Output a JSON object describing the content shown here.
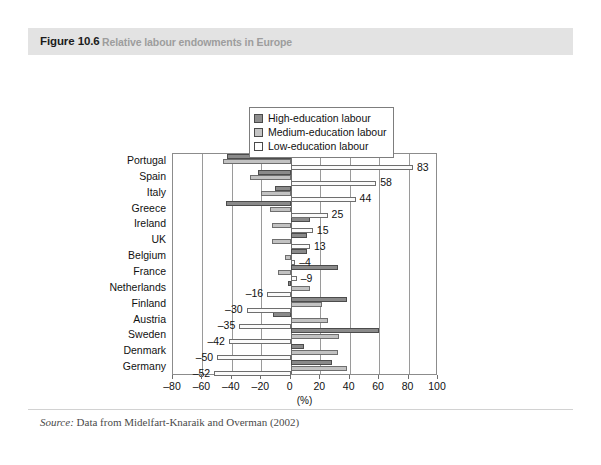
{
  "figure": {
    "number": "Figure 10.6",
    "caption": "Relative labour endowments in Europe",
    "source_keyword": "Source:",
    "source_text": " Data from Midelfart-Knaraik and Overman (2002)"
  },
  "legend": {
    "items": [
      {
        "label": "High-education labour",
        "key": "high",
        "color": "#8a8a8a"
      },
      {
        "label": "Medium-education labour",
        "key": "medium",
        "color": "#c2c2c2"
      },
      {
        "label": "Low-education labour",
        "key": "low",
        "color": "#ffffff"
      }
    ]
  },
  "chart_data": {
    "type": "bar",
    "orientation": "horizontal",
    "title": "Relative labour endowments in Europe",
    "xlabel": "(%)",
    "ylabel": "",
    "xlim": [
      -80,
      100
    ],
    "xticks": [
      -80,
      -60,
      -40,
      -20,
      0,
      20,
      40,
      60,
      80,
      100
    ],
    "xtick_labels": [
      "–80",
      "–60",
      "–40",
      "–20",
      "0",
      "20",
      "40",
      "60",
      "80",
      "100"
    ],
    "grid": true,
    "legend_position": "top-center",
    "categories": [
      "Portugal",
      "Spain",
      "Italy",
      "Greece",
      "Ireland",
      "UK",
      "Belgium",
      "France",
      "Netherlands",
      "Finland",
      "Austria",
      "Sweden",
      "Denmark",
      "Germany"
    ],
    "series": [
      {
        "name": "High-education labour",
        "key": "high",
        "color": "#8a8a8a",
        "values": [
          -43,
          -22,
          -11,
          -44,
          13,
          11,
          11,
          32,
          -2,
          38,
          -12,
          60,
          9,
          28
        ]
      },
      {
        "name": "Medium-education labour",
        "key": "medium",
        "color": "#c2c2c2",
        "values": [
          -46,
          -28,
          -20,
          -14,
          -13,
          -13,
          -4,
          -9,
          13,
          21,
          25,
          33,
          32,
          38
        ]
      },
      {
        "name": "Low-education labour",
        "key": "low",
        "color": "#ffffff",
        "values": [
          83,
          58,
          44,
          25,
          15,
          13,
          3,
          4,
          -16,
          -30,
          -35,
          -42,
          -50,
          -52
        ]
      }
    ],
    "data_labels": [
      {
        "category": "Portugal",
        "series": "low",
        "text": "83",
        "value": 83
      },
      {
        "category": "Spain",
        "series": "low",
        "text": "58",
        "value": 58
      },
      {
        "category": "Italy",
        "series": "low",
        "text": "44",
        "value": 44
      },
      {
        "category": "Greece",
        "series": "low",
        "text": "25",
        "value": 25
      },
      {
        "category": "Ireland",
        "series": "low",
        "text": "15",
        "value": 15
      },
      {
        "category": "UK",
        "series": "low",
        "text": "13",
        "value": 13
      },
      {
        "category": "Belgium",
        "series": "low",
        "text": "–4",
        "value": -4
      },
      {
        "category": "France",
        "series": "low",
        "text": "–9",
        "value": -9
      },
      {
        "category": "Netherlands",
        "series": "low",
        "text": "–16",
        "value": -16
      },
      {
        "category": "Finland",
        "series": "low",
        "text": "–30",
        "value": -30
      },
      {
        "category": "Austria",
        "series": "low",
        "text": "–35",
        "value": -35
      },
      {
        "category": "Sweden",
        "series": "low",
        "text": "–42",
        "value": -42
      },
      {
        "category": "Denmark",
        "series": "low",
        "text": "–50",
        "value": -50
      },
      {
        "category": "Germany",
        "series": "low",
        "text": "–52",
        "value": -52
      }
    ]
  }
}
